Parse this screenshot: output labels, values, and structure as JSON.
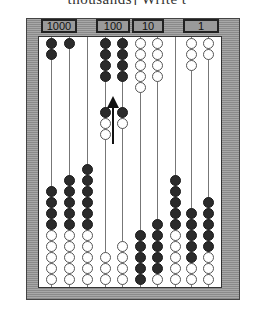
{
  "header_text": "thousands]  Write t",
  "labels": [
    {
      "text": "1000",
      "left": 41,
      "width": 36
    },
    {
      "text": "100",
      "left": 96,
      "width": 34
    },
    {
      "text": "10",
      "left": 132,
      "width": 32
    },
    {
      "text": "1",
      "left": 183,
      "width": 36
    }
  ],
  "colors": {
    "black_bead": "#2b2b2b",
    "white_bead": "#ffffff",
    "frame": "#9a9a9a"
  },
  "layout": {
    "bead_pitch": 11,
    "top_start_y": 38,
    "bottom_base_y": 274
  },
  "columns": [
    {
      "x": 51,
      "top": [],
      "top_black": 2,
      "top_white": 0,
      "bottom_black": 4,
      "bottom_white": 5
    },
    {
      "x": 69,
      "top_black": 1,
      "top_white": 0,
      "bottom_black": 5,
      "bottom_white": 5
    },
    {
      "x": 87,
      "top_black": 0,
      "top_white": 0,
      "bottom_black": 6,
      "bottom_white": 5
    },
    {
      "x": 105,
      "top_black": 4,
      "top_white": 0,
      "mid": [
        "black",
        "white",
        "white"
      ],
      "bottom_black": 0,
      "bottom_white": 3
    },
    {
      "x": 122,
      "top_black": 4,
      "top_white": 0,
      "mid": [
        "black",
        "white"
      ],
      "bottom_black": 0,
      "bottom_white": 4
    },
    {
      "x": 140,
      "top_black": 0,
      "top_white": 5,
      "bottom_black": 5,
      "bottom_white": 0
    },
    {
      "x": 157,
      "top_black": 0,
      "top_white": 4,
      "bottom_black": 5,
      "bottom_white": 1
    },
    {
      "x": 175,
      "top_black": 0,
      "top_white": 0,
      "bottom_black": 5,
      "bottom_white": 5
    },
    {
      "x": 191,
      "top_black": 0,
      "top_white": 3,
      "bottom_black": 5,
      "bottom_white": 2
    },
    {
      "x": 208,
      "top_black": 0,
      "top_white": 2,
      "bottom_black": 5,
      "bottom_white": 3
    }
  ],
  "mid_start_y": 107,
  "arrow": {
    "direction": "up",
    "x": 113
  }
}
